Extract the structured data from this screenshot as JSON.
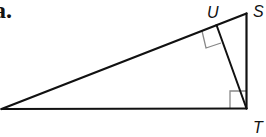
{
  "problem": {
    "part_label": "a."
  },
  "diagram": {
    "type": "right-triangle-with-altitude",
    "vertices": [
      {
        "id": "left",
        "label": "",
        "x": 1.5,
        "y": 109
      },
      {
        "id": "S",
        "label": "S",
        "x": 246.5,
        "y": 13.5
      },
      {
        "id": "T",
        "label": "T",
        "x": 246.5,
        "y": 108.5
      },
      {
        "id": "U",
        "label": "U",
        "x": 216.5,
        "y": 25
      }
    ],
    "segments": [
      [
        "left",
        "S"
      ],
      [
        "S",
        "T"
      ],
      [
        "T",
        "left"
      ],
      [
        "U",
        "T"
      ]
    ],
    "right_angles": [
      "T",
      "U"
    ],
    "colors": {
      "line": "#111111",
      "marker": "#888888"
    }
  }
}
